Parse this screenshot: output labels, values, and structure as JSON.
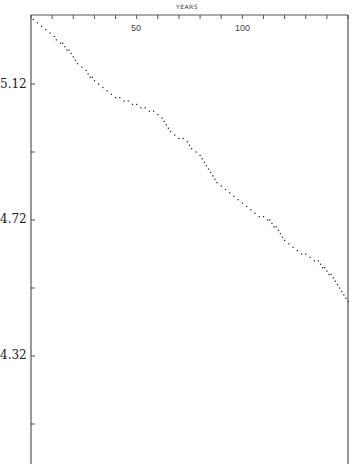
{
  "chart_data": {
    "type": "scatter",
    "title": "",
    "xlabel": "YEARS",
    "ylabel": "",
    "xlim": [
      0,
      150
    ],
    "ylim": [
      4.0,
      5.32
    ],
    "x_ticks_major_labeled": [
      50,
      100
    ],
    "x_tick_step": 10,
    "y_tick_labels": [
      "5.12",
      "4.72",
      "4.32"
    ],
    "y_tick_values": [
      5.12,
      4.92,
      4.72,
      4.52,
      4.32,
      4.12
    ],
    "grid": false,
    "legend": null,
    "series": [
      {
        "name": "data",
        "x": [
          1,
          3,
          5,
          7,
          9,
          11,
          12,
          14,
          15,
          16,
          17,
          18,
          19,
          20,
          21,
          22,
          24,
          26,
          27,
          28,
          29,
          30,
          32,
          34,
          36,
          38,
          40,
          42,
          44,
          46,
          48,
          50,
          52,
          54,
          56,
          58,
          60,
          62,
          63,
          64,
          65,
          66,
          68,
          70,
          72,
          74,
          75,
          76,
          78,
          80,
          81,
          82,
          83,
          84,
          85,
          86,
          87,
          88,
          90,
          92,
          94,
          96,
          98,
          100,
          102,
          104,
          106,
          108,
          110,
          112,
          113,
          114,
          115,
          116,
          117,
          118,
          119,
          120,
          122,
          124,
          126,
          128,
          130,
          132,
          134,
          136,
          137,
          138,
          139,
          140,
          141,
          142,
          143,
          144,
          145,
          146,
          147,
          148,
          149,
          150
        ],
        "y": [
          5.31,
          5.3,
          5.29,
          5.28,
          5.27,
          5.26,
          5.25,
          5.24,
          5.24,
          5.23,
          5.22,
          5.22,
          5.21,
          5.2,
          5.19,
          5.18,
          5.17,
          5.16,
          5.15,
          5.14,
          5.14,
          5.13,
          5.12,
          5.11,
          5.1,
          5.09,
          5.08,
          5.08,
          5.07,
          5.07,
          5.06,
          5.06,
          5.05,
          5.05,
          5.04,
          5.04,
          5.03,
          5.02,
          5.01,
          5.0,
          4.99,
          4.98,
          4.97,
          4.96,
          4.96,
          4.95,
          4.94,
          4.93,
          4.92,
          4.91,
          4.9,
          4.89,
          4.88,
          4.87,
          4.86,
          4.85,
          4.84,
          4.83,
          4.82,
          4.81,
          4.8,
          4.79,
          4.78,
          4.77,
          4.76,
          4.75,
          4.74,
          4.73,
          4.73,
          4.72,
          4.72,
          4.71,
          4.7,
          4.7,
          4.69,
          4.68,
          4.67,
          4.66,
          4.65,
          4.64,
          4.63,
          4.62,
          4.62,
          4.61,
          4.6,
          4.6,
          4.59,
          4.58,
          4.58,
          4.57,
          4.56,
          4.56,
          4.55,
          4.54,
          4.53,
          4.52,
          4.51,
          4.5,
          4.49,
          4.48
        ]
      }
    ]
  },
  "axis": {
    "x_title": "YEARS",
    "x_labels": [
      {
        "value": 50,
        "text": "50"
      },
      {
        "value": 100,
        "text": "100"
      }
    ],
    "y_labels": [
      {
        "value": 5.12,
        "text": "5.12"
      },
      {
        "value": 4.72,
        "text": "4.72"
      },
      {
        "value": 4.32,
        "text": "4.32"
      }
    ]
  },
  "colors": {
    "axis": "#555555",
    "points": "#333333"
  }
}
